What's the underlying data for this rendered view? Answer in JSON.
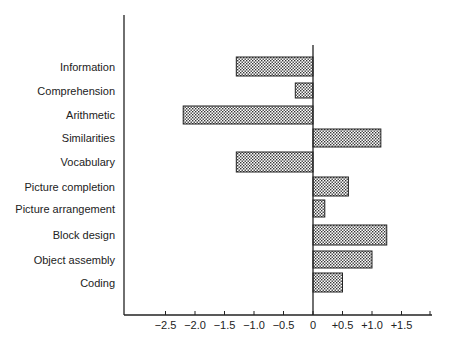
{
  "chart_data": {
    "type": "bar",
    "orientation": "horizontal",
    "title": "",
    "xlabel": "",
    "ylabel": "",
    "categories": [
      "Information",
      "Comprehension",
      "Arithmetic",
      "Similarities",
      "Vocabulary",
      "Picture completion",
      "Picture arrangement",
      "Block design",
      "Object assembly",
      "Coding"
    ],
    "values": [
      -1.3,
      -0.3,
      -2.2,
      1.15,
      -1.3,
      0.6,
      0.2,
      1.25,
      1.0,
      0.5
    ],
    "xlim": [
      -2.75,
      2.0
    ],
    "xticks": [
      -2.5,
      -2.0,
      -1.5,
      -1.0,
      -0.5,
      0,
      0.5,
      1.0,
      1.5
    ],
    "xtick_labels": [
      "−2.5",
      "−2.0",
      "−1.5",
      "−1.0",
      "−0.5",
      "0",
      "+0.5",
      "+1.0",
      "+1.5"
    ],
    "grid": false,
    "legend": null,
    "bar_fill": "stippled grey pattern",
    "colors": {
      "axis": "#222222",
      "bar_dot": "#333333",
      "bar_bg": "#ffffff"
    }
  }
}
